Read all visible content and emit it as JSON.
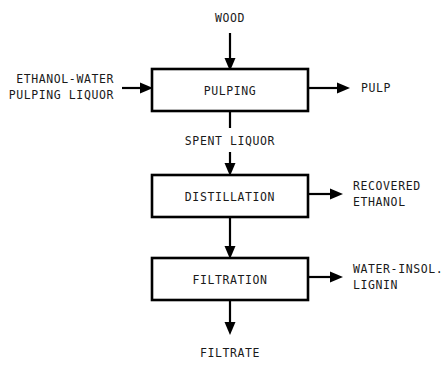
{
  "diagram": {
    "type": "process-flow-diagram",
    "colors": {
      "background": "#ffffff",
      "line": "#000000",
      "text": "#1a1a1a",
      "box_fill": "#ffffff"
    },
    "units": [
      {
        "id": "pulping",
        "label": "PULPING"
      },
      {
        "id": "distillation",
        "label": "DISTILLATION"
      },
      {
        "id": "filtration",
        "label": "FILTRATION"
      }
    ],
    "streams": {
      "wood": {
        "label": "WOOD",
        "direction": "in-top",
        "target": "pulping"
      },
      "pulping_liquor": {
        "label_line1": "ETHANOL-WATER",
        "label_line2": "PULPING LIQUOR",
        "direction": "in-left",
        "target": "pulping"
      },
      "pulp": {
        "label": "PULP",
        "direction": "out-right",
        "source": "pulping"
      },
      "spent_liquor": {
        "label": "SPENT LIQUOR",
        "direction": "down",
        "source": "pulping",
        "target": "distillation"
      },
      "recovered_ethanol": {
        "label_line1": "RECOVERED",
        "label_line2": "ETHANOL",
        "direction": "out-right",
        "source": "distillation"
      },
      "to_filtration": {
        "label": "",
        "direction": "down",
        "source": "distillation",
        "target": "filtration"
      },
      "lignin": {
        "label_line1": "WATER-INSOL.",
        "label_line2": "LIGNIN",
        "direction": "out-right",
        "source": "filtration"
      },
      "filtrate": {
        "label": "FILTRATE",
        "direction": "out-bottom",
        "source": "filtration"
      }
    }
  }
}
